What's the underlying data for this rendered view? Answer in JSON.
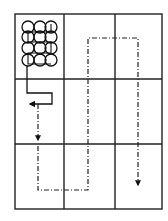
{
  "diagram": {
    "type": "grid-path-diagram",
    "grid": {
      "rows": 3,
      "cols": 3,
      "x_lines": [
        15,
        64,
        115,
        162
      ],
      "y_lines": [
        14,
        79,
        144,
        209
      ],
      "stroke": "#222222"
    },
    "circle_cluster": {
      "cell": [
        0,
        0
      ],
      "rows": 4,
      "cols": 3,
      "radius": 6,
      "centers_x": [
        28,
        40,
        51
      ],
      "centers_y": [
        27,
        37,
        48,
        60
      ],
      "stroke": "#111111"
    },
    "paths": [
      {
        "name": "solid-exit-path",
        "style": "solid",
        "color": "#111111"
      },
      {
        "name": "dash-dot-scan-path",
        "style": "dash-dot",
        "color": "#222222"
      }
    ],
    "arrows": [
      {
        "name": "left-arrow",
        "direction": "left"
      },
      {
        "name": "down-arrow-left",
        "direction": "down"
      },
      {
        "name": "down-arrow-right",
        "direction": "down"
      }
    ]
  }
}
